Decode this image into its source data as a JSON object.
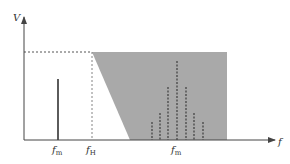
{
  "diagram": {
    "type": "frequency-spectrum",
    "axes": {
      "y_label": "V",
      "x_label": "f"
    },
    "labels": {
      "fm_low": {
        "main": "f",
        "sub": "m"
      },
      "fH": {
        "main": "f",
        "sub": "H"
      },
      "fm_high": {
        "main": "f",
        "sub": "m"
      }
    },
    "colors": {
      "shaded_region": "#a9a9a9",
      "axis": "#555555",
      "line": "#333333",
      "dashed": "#555555",
      "background": "#ffffff"
    },
    "baseband_line": {
      "x": 58,
      "top": 79
    },
    "cutoff_level_y": 52,
    "cutoff_x": 92,
    "shaded_region": {
      "top_left_x": 92,
      "bottom_left_x": 130,
      "right_x": 227,
      "top_y": 52,
      "bottom_y": 140
    },
    "harmonic_lines": [
      {
        "x": 152,
        "top": 122
      },
      {
        "x": 160,
        "top": 113
      },
      {
        "x": 168,
        "top": 87
      },
      {
        "x": 177,
        "top": 61
      },
      {
        "x": 186,
        "top": 87
      },
      {
        "x": 194,
        "top": 113
      },
      {
        "x": 203,
        "top": 122
      }
    ]
  }
}
